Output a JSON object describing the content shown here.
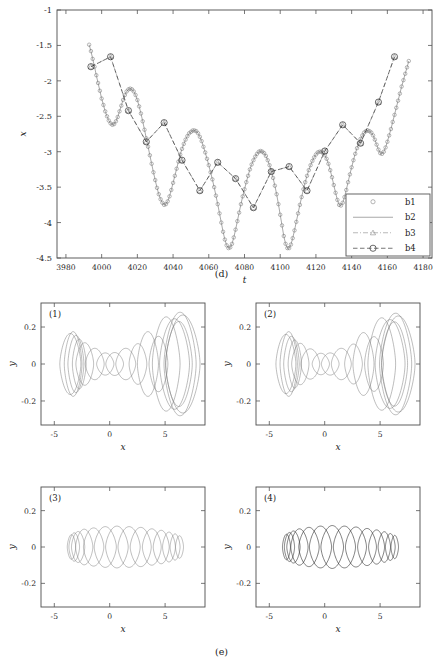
{
  "figure": {
    "caption_d": "(d)",
    "caption_e": "(e)"
  },
  "chart_data": [
    {
      "id": "panel-d",
      "type": "line",
      "title": "",
      "xlabel": "t",
      "ylabel": "x",
      "xlim": [
        3975,
        4185
      ],
      "ylim": [
        -4.5,
        -1.0
      ],
      "xticks": [
        3980,
        4000,
        4020,
        4040,
        4060,
        4080,
        4100,
        4120,
        4140,
        4160,
        4180
      ],
      "yticks": [
        -1,
        -1.5,
        -2,
        -2.5,
        -3,
        -3.5,
        -4,
        -4.5
      ],
      "xtick_labels": [
        "3980",
        "4000",
        "4020",
        "4040",
        "4060",
        "4080",
        "4100",
        "4120",
        "4140",
        "4160",
        "4180"
      ],
      "ytick_labels": [
        "-1",
        "-1.5",
        "-2",
        "-2.5",
        "-3",
        "-3.5",
        "-4",
        "-4.5"
      ],
      "grid": false,
      "legend_position": "lower-right",
      "legend": [
        {
          "label": "b1",
          "style": "marker-only",
          "marker": "circle",
          "color": "#6f6f6f"
        },
        {
          "label": "b2",
          "style": "solid",
          "marker": "none",
          "color": "#6f6f6f"
        },
        {
          "label": "b3",
          "style": "dash-dot",
          "marker": "triangle",
          "color": "#8a8a8a"
        },
        {
          "label": "b4",
          "style": "dashed",
          "marker": "circle",
          "color": "#2c2c2c"
        }
      ],
      "series": [
        {
          "name": "b1",
          "comment": "dense oscillatory carrier, small open circle markers at every sample",
          "marker": "circle-small",
          "line": "solid",
          "x": [
            3993,
            3994,
            3995,
            3996,
            3997,
            3998,
            3999,
            4000,
            4001,
            4002,
            4003,
            4004,
            4005,
            4006,
            4007,
            4008,
            4009,
            4010,
            4011,
            4012,
            4013,
            4014,
            4015,
            4016,
            4017,
            4018,
            4019,
            4020,
            4021,
            4022,
            4023,
            4024,
            4025,
            4026,
            4027,
            4028,
            4029,
            4030,
            4031,
            4032,
            4033,
            4034,
            4035,
            4036,
            4037,
            4038,
            4039,
            4040,
            4041,
            4042,
            4043,
            4044,
            4045,
            4046,
            4047,
            4048,
            4049,
            4050,
            4051,
            4052,
            4053,
            4054,
            4055,
            4056,
            4057,
            4058,
            4059,
            4060,
            4061,
            4062,
            4063,
            4064,
            4065,
            4066,
            4067,
            4068,
            4069,
            4070,
            4071,
            4072,
            4073,
            4074,
            4075,
            4076,
            4077,
            4078,
            4079,
            4080,
            4081,
            4082,
            4083,
            4084,
            4085,
            4086,
            4087,
            4088,
            4089,
            4090,
            4091,
            4092,
            4093,
            4094,
            4095,
            4096,
            4097,
            4098,
            4099,
            4100,
            4101,
            4102,
            4103,
            4104,
            4105,
            4106,
            4107,
            4108,
            4109,
            4110,
            4111,
            4112,
            4113,
            4114,
            4115,
            4116,
            4117,
            4118,
            4119,
            4120,
            4121,
            4122,
            4123,
            4124,
            4125,
            4126,
            4127,
            4128,
            4129,
            4130,
            4131,
            4132,
            4133,
            4134,
            4135,
            4136,
            4137,
            4138,
            4139,
            4140,
            4141,
            4142,
            4143,
            4144,
            4145,
            4146,
            4147,
            4148,
            4149,
            4150,
            4151,
            4152,
            4153,
            4154,
            4155,
            4156,
            4157,
            4158,
            4159,
            4160,
            4161,
            4162,
            4163,
            4164,
            4165,
            4166,
            4167,
            4168,
            4169,
            4170,
            4171,
            4172
          ],
          "y": [
            -1.49,
            -1.58,
            -1.69,
            -1.8,
            -1.92,
            -2.03,
            -2.14,
            -2.25,
            -2.34,
            -2.43,
            -2.5,
            -2.56,
            -2.6,
            -2.62,
            -2.61,
            -2.57,
            -2.51,
            -2.43,
            -2.35,
            -2.27,
            -2.2,
            -2.15,
            -2.12,
            -2.11,
            -2.12,
            -2.15,
            -2.2,
            -2.27,
            -2.36,
            -2.46,
            -2.57,
            -2.69,
            -2.81,
            -2.93,
            -3.05,
            -3.17,
            -3.29,
            -3.4,
            -3.51,
            -3.6,
            -3.67,
            -3.72,
            -3.75,
            -3.74,
            -3.7,
            -3.63,
            -3.54,
            -3.44,
            -3.34,
            -3.24,
            -3.14,
            -3.04,
            -2.96,
            -2.89,
            -2.83,
            -2.78,
            -2.74,
            -2.72,
            -2.7,
            -2.7,
            -2.71,
            -2.74,
            -2.79,
            -2.85,
            -2.93,
            -3.01,
            -3.1,
            -3.19,
            -3.29,
            -3.39,
            -3.5,
            -3.62,
            -3.74,
            -3.87,
            -4.0,
            -4.13,
            -4.24,
            -4.32,
            -4.36,
            -4.35,
            -4.3,
            -4.21,
            -4.1,
            -3.98,
            -3.86,
            -3.74,
            -3.63,
            -3.53,
            -3.43,
            -3.34,
            -3.25,
            -3.18,
            -3.12,
            -3.07,
            -3.03,
            -3.0,
            -2.99,
            -3.0,
            -3.02,
            -3.06,
            -3.12,
            -3.19,
            -3.27,
            -3.37,
            -3.48,
            -3.6,
            -3.74,
            -3.89,
            -4.04,
            -4.19,
            -4.3,
            -4.36,
            -4.36,
            -4.31,
            -4.22,
            -4.11,
            -3.99,
            -3.87,
            -3.75,
            -3.64,
            -3.53,
            -3.43,
            -3.34,
            -3.26,
            -3.19,
            -3.13,
            -3.08,
            -3.04,
            -3.01,
            -3.0,
            -3.0,
            -3.02,
            -3.05,
            -3.1,
            -3.17,
            -3.26,
            -3.36,
            -3.47,
            -3.58,
            -3.68,
            -3.75,
            -3.76,
            -3.72,
            -3.64,
            -3.54,
            -3.43,
            -3.32,
            -3.22,
            -3.12,
            -3.03,
            -2.95,
            -2.88,
            -2.82,
            -2.77,
            -2.73,
            -2.71,
            -2.7,
            -2.71,
            -2.73,
            -2.77,
            -2.83,
            -2.9,
            -2.97,
            -3.02,
            -3.03,
            -3.0,
            -2.94,
            -2.86,
            -2.77,
            -2.68,
            -2.58,
            -2.48,
            -2.38,
            -2.28,
            -2.18,
            -2.08,
            -1.99,
            -1.9,
            -1.81,
            -1.72,
            -1.63,
            -1.55
          ],
          "note": "this is the reference dense trace shared by b1 and b2"
        },
        {
          "name": "b2",
          "comment": "solid line through the same dense samples (overlays b1)",
          "marker": "none",
          "line": "solid",
          "same_as": "b1"
        },
        {
          "name": "b3",
          "comment": "dash-dot envelope sampled sparsely, triangle markers, coincides with b4",
          "marker": "triangle",
          "line": "dash-dot",
          "x": [
            3994,
            4005,
            4015,
            4025,
            4035,
            4045,
            4055,
            4065,
            4075,
            4085,
            4095,
            4105,
            4115,
            4125,
            4135,
            4145,
            4155,
            4164
          ],
          "y": [
            -1.8,
            -1.66,
            -2.42,
            -2.86,
            -2.59,
            -3.12,
            -3.55,
            -3.15,
            -3.38,
            -3.79,
            -3.28,
            -3.21,
            -3.55,
            -2.99,
            -2.62,
            -2.88,
            -2.3,
            -1.66
          ]
        },
        {
          "name": "b4",
          "comment": "dashed envelope with large open circle markers",
          "marker": "circle-large",
          "line": "dashed",
          "x": [
            3994,
            4005,
            4015,
            4025,
            4035,
            4045,
            4055,
            4065,
            4075,
            4085,
            4095,
            4105,
            4115,
            4125,
            4135,
            4145,
            4155,
            4164
          ],
          "y": [
            -1.8,
            -1.66,
            -2.42,
            -2.86,
            -2.59,
            -3.12,
            -3.55,
            -3.15,
            -3.38,
            -3.79,
            -3.28,
            -3.21,
            -3.55,
            -2.99,
            -2.62,
            -2.88,
            -2.3,
            -1.66
          ]
        }
      ]
    },
    {
      "id": "panel-e-1",
      "tag": "(1)",
      "type": "line",
      "xlabel": "x",
      "ylabel": "y",
      "xlim": [
        -6.2,
        8.6
      ],
      "ylim": [
        -0.33,
        0.33
      ],
      "xticks": [
        -5,
        0,
        5
      ],
      "yticks": [
        0.2,
        0,
        -0.2
      ],
      "xtick_labels": [
        "-5",
        "0",
        "5"
      ],
      "ytick_labels": [
        "0.2",
        "0",
        "-0.2"
      ],
      "grid": false,
      "style": "light",
      "orbits": [
        {
          "cx": -3.55,
          "cy": 0.0,
          "rx": 0.95,
          "ry": 0.165
        },
        {
          "cx": -3.3,
          "cy": 0.0,
          "rx": 0.8,
          "ry": 0.175
        },
        {
          "cx": -3.05,
          "cy": 0.0,
          "rx": 0.72,
          "ry": 0.155
        },
        {
          "cx": -2.75,
          "cy": 0.0,
          "rx": 0.62,
          "ry": 0.135
        },
        {
          "cx": -2.25,
          "cy": 0.0,
          "rx": 0.8,
          "ry": 0.115
        },
        {
          "cx": -1.35,
          "cy": 0.0,
          "rx": 0.85,
          "ry": 0.085
        },
        {
          "cx": -0.4,
          "cy": 0.0,
          "rx": 0.78,
          "ry": 0.06
        },
        {
          "cx": 0.45,
          "cy": 0.0,
          "rx": 0.8,
          "ry": 0.062
        },
        {
          "cx": 1.45,
          "cy": 0.0,
          "rx": 0.9,
          "ry": 0.085
        },
        {
          "cx": 2.55,
          "cy": 0.0,
          "rx": 0.8,
          "ry": 0.11
        },
        {
          "cx": 3.45,
          "cy": 0.0,
          "rx": 0.95,
          "ry": 0.175
        },
        {
          "cx": 4.4,
          "cy": 0.0,
          "rx": 0.85,
          "ry": 0.15
        },
        {
          "cx": 5.1,
          "cy": 0.0,
          "rx": 1.25,
          "ry": 0.255
        },
        {
          "cx": 5.85,
          "cy": 0.0,
          "rx": 1.35,
          "ry": 0.245
        },
        {
          "cx": 6.35,
          "cy": 0.0,
          "rx": 1.45,
          "ry": 0.28
        },
        {
          "cx": 6.6,
          "cy": 0.0,
          "rx": 1.55,
          "ry": 0.265
        },
        {
          "cx": 6.25,
          "cy": 0.0,
          "rx": 1.2,
          "ry": 0.23
        }
      ]
    },
    {
      "id": "panel-e-2",
      "tag": "(2)",
      "type": "line",
      "xlabel": "x",
      "ylabel": "y",
      "xlim": [
        -6.2,
        8.6
      ],
      "ylim": [
        -0.33,
        0.33
      ],
      "xticks": [
        -5,
        0,
        5
      ],
      "yticks": [
        0.2,
        0,
        -0.2
      ],
      "xtick_labels": [
        "-5",
        "0",
        "5"
      ],
      "ytick_labels": [
        "0.2",
        "0",
        "-0.2"
      ],
      "grid": false,
      "style": "light",
      "orbits": [
        {
          "cx": -3.5,
          "cy": 0.0,
          "rx": 0.9,
          "ry": 0.16
        },
        {
          "cx": -3.25,
          "cy": 0.0,
          "rx": 0.78,
          "ry": 0.175
        },
        {
          "cx": -3.0,
          "cy": 0.0,
          "rx": 0.7,
          "ry": 0.15
        },
        {
          "cx": -2.7,
          "cy": 0.0,
          "rx": 0.6,
          "ry": 0.13
        },
        {
          "cx": -2.2,
          "cy": 0.0,
          "rx": 0.78,
          "ry": 0.112
        },
        {
          "cx": -1.3,
          "cy": 0.0,
          "rx": 0.85,
          "ry": 0.082
        },
        {
          "cx": -0.35,
          "cy": 0.0,
          "rx": 0.78,
          "ry": 0.058
        },
        {
          "cx": 0.5,
          "cy": 0.0,
          "rx": 0.8,
          "ry": 0.06
        },
        {
          "cx": 1.5,
          "cy": 0.0,
          "rx": 0.9,
          "ry": 0.085
        },
        {
          "cx": 2.6,
          "cy": 0.0,
          "rx": 0.8,
          "ry": 0.108
        },
        {
          "cx": 3.5,
          "cy": 0.0,
          "rx": 0.95,
          "ry": 0.17
        },
        {
          "cx": 4.45,
          "cy": 0.0,
          "rx": 0.85,
          "ry": 0.148
        },
        {
          "cx": 5.15,
          "cy": 0.0,
          "rx": 1.25,
          "ry": 0.25
        },
        {
          "cx": 5.9,
          "cy": 0.0,
          "rx": 1.35,
          "ry": 0.24
        },
        {
          "cx": 6.4,
          "cy": 0.0,
          "rx": 1.45,
          "ry": 0.275
        },
        {
          "cx": 6.65,
          "cy": 0.0,
          "rx": 1.5,
          "ry": 0.26
        },
        {
          "cx": 6.3,
          "cy": 0.0,
          "rx": 1.18,
          "ry": 0.228
        }
      ]
    },
    {
      "id": "panel-e-3",
      "tag": "(3)",
      "type": "line",
      "xlabel": "x",
      "ylabel": "y",
      "xlim": [
        -6.2,
        8.6
      ],
      "ylim": [
        -0.33,
        0.33
      ],
      "xticks": [
        -5,
        0,
        5
      ],
      "yticks": [
        0.2,
        0,
        -0.2
      ],
      "xtick_labels": [
        "-5",
        "0",
        "5"
      ],
      "ytick_labels": [
        "0.2",
        "0",
        "-0.2"
      ],
      "grid": false,
      "style": "light",
      "orbits": [
        {
          "cx": -3.45,
          "cy": 0.0,
          "rx": 0.38,
          "ry": 0.068
        },
        {
          "cx": -3.2,
          "cy": 0.0,
          "rx": 0.48,
          "ry": 0.078
        },
        {
          "cx": -2.85,
          "cy": 0.0,
          "rx": 0.6,
          "ry": 0.085
        },
        {
          "cx": -2.3,
          "cy": 0.0,
          "rx": 0.78,
          "ry": 0.098
        },
        {
          "cx": -1.45,
          "cy": 0.0,
          "rx": 0.92,
          "ry": 0.105
        },
        {
          "cx": -0.4,
          "cy": 0.0,
          "rx": 1.0,
          "ry": 0.112
        },
        {
          "cx": 0.65,
          "cy": 0.0,
          "rx": 1.02,
          "ry": 0.115
        },
        {
          "cx": 1.75,
          "cy": 0.0,
          "rx": 1.0,
          "ry": 0.112
        },
        {
          "cx": 2.8,
          "cy": 0.0,
          "rx": 0.95,
          "ry": 0.108
        },
        {
          "cx": 3.8,
          "cy": 0.0,
          "rx": 0.85,
          "ry": 0.1
        },
        {
          "cx": 4.65,
          "cy": 0.0,
          "rx": 0.72,
          "ry": 0.092
        },
        {
          "cx": 5.35,
          "cy": 0.0,
          "rx": 0.58,
          "ry": 0.082
        },
        {
          "cx": 5.9,
          "cy": 0.0,
          "rx": 0.45,
          "ry": 0.072
        },
        {
          "cx": 6.3,
          "cy": 0.0,
          "rx": 0.36,
          "ry": 0.062
        }
      ]
    },
    {
      "id": "panel-e-4",
      "tag": "(4)",
      "type": "line",
      "xlabel": "x",
      "ylabel": "y",
      "xlim": [
        -6.2,
        8.6
      ],
      "ylim": [
        -0.33,
        0.33
      ],
      "xticks": [
        -5,
        0,
        5
      ],
      "yticks": [
        0.2,
        0,
        -0.2
      ],
      "xtick_labels": [
        "-5",
        "0",
        "5"
      ],
      "ytick_labels": [
        "0.2",
        "0",
        "-0.2"
      ],
      "grid": false,
      "style": "dark",
      "orbits": [
        {
          "cx": -3.45,
          "cy": 0.0,
          "rx": 0.36,
          "ry": 0.07
        },
        {
          "cx": -3.18,
          "cy": 0.0,
          "rx": 0.46,
          "ry": 0.08
        },
        {
          "cx": -2.82,
          "cy": 0.0,
          "rx": 0.6,
          "ry": 0.088
        },
        {
          "cx": -2.28,
          "cy": 0.0,
          "rx": 0.78,
          "ry": 0.1
        },
        {
          "cx": -1.42,
          "cy": 0.0,
          "rx": 0.92,
          "ry": 0.108
        },
        {
          "cx": -0.38,
          "cy": 0.0,
          "rx": 1.0,
          "ry": 0.115
        },
        {
          "cx": 0.68,
          "cy": 0.0,
          "rx": 1.02,
          "ry": 0.118
        },
        {
          "cx": 1.78,
          "cy": 0.0,
          "rx": 1.0,
          "ry": 0.115
        },
        {
          "cx": 2.82,
          "cy": 0.0,
          "rx": 0.95,
          "ry": 0.11
        },
        {
          "cx": 3.82,
          "cy": 0.0,
          "rx": 0.85,
          "ry": 0.102
        },
        {
          "cx": 4.68,
          "cy": 0.0,
          "rx": 0.72,
          "ry": 0.094
        },
        {
          "cx": 5.38,
          "cy": 0.0,
          "rx": 0.56,
          "ry": 0.084
        },
        {
          "cx": 5.92,
          "cy": 0.0,
          "rx": 0.44,
          "ry": 0.074
        },
        {
          "cx": 6.32,
          "cy": 0.0,
          "rx": 0.34,
          "ry": 0.064
        }
      ]
    }
  ]
}
